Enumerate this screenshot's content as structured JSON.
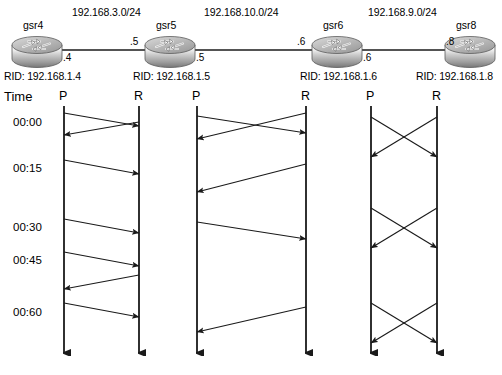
{
  "topology": {
    "networks": [
      {
        "label": "192.168.3.0/24",
        "x": 72,
        "y": 6
      },
      {
        "label": "192.168.10.0/24",
        "x": 204,
        "y": 6
      },
      {
        "label": "192.168.9.0/24",
        "x": 368,
        "y": 6
      }
    ],
    "routers": [
      {
        "name": "gsr4",
        "icon": "router-icon",
        "cx": 37,
        "cy": 45,
        "name_x": 23,
        "name_y": 19
      },
      {
        "name": "gsr5",
        "icon": "router-icon",
        "cx": 170,
        "cy": 45,
        "name_x": 156,
        "name_y": 19
      },
      {
        "name": "gsr6",
        "icon": "router-icon",
        "cx": 337,
        "cy": 45,
        "name_x": 323,
        "name_y": 19
      },
      {
        "name": "gsr8",
        "icon": "router-icon",
        "cx": 470,
        "cy": 45,
        "name_x": 456,
        "name_y": 19
      }
    ],
    "interfaces": [
      {
        "label": ".4",
        "x": 63,
        "y": 52
      },
      {
        "label": ".5",
        "x": 130,
        "y": 36
      },
      {
        "label": ".5",
        "x": 196,
        "y": 52
      },
      {
        "label": ".6",
        "x": 297,
        "y": 36
      },
      {
        "label": ".6",
        "x": 363,
        "y": 52
      },
      {
        "label": ".8",
        "x": 446,
        "y": 36
      }
    ],
    "rids": [
      {
        "label": "RID: 192.168.1.4",
        "x": 4,
        "y": 70
      },
      {
        "label": "RID: 192.168.1.5",
        "x": 133,
        "y": 70
      },
      {
        "label": "RID: 192.168.1.6",
        "x": 300,
        "y": 70
      },
      {
        "label": "RID: 192.168.1.8",
        "x": 416,
        "y": 70
      }
    ]
  },
  "timing": {
    "time_axis_label": "Time",
    "time_label_x": 4,
    "time_label_y": 89,
    "ticks": [
      {
        "label": "00:00",
        "x": 13,
        "y": 116
      },
      {
        "label": "00:15",
        "x": 13,
        "y": 162
      },
      {
        "label": "00:30",
        "x": 13,
        "y": 221
      },
      {
        "label": "00:45",
        "x": 13,
        "y": 254
      },
      {
        "label": "00:60",
        "x": 13,
        "y": 306
      }
    ],
    "columns": [
      {
        "label": "P",
        "x": 59,
        "line_x": 64,
        "header_y": 89
      },
      {
        "label": "R",
        "x": 134,
        "line_x": 139,
        "header_y": 89
      },
      {
        "label": "P",
        "x": 192,
        "line_x": 197,
        "header_y": 89
      },
      {
        "label": "R",
        "x": 301,
        "line_x": 306,
        "header_y": 89
      },
      {
        "label": "P",
        "x": 366,
        "line_x": 371,
        "header_y": 89
      },
      {
        "label": "R",
        "x": 432,
        "line_x": 437,
        "header_y": 89
      }
    ],
    "lifeline_top": 106,
    "lifeline_bottom": 362,
    "groups": [
      {
        "name": "group-gsr4-gsr5",
        "left_x": 64,
        "right_x": 139,
        "messages": [
          {
            "dir": "lr",
            "y1": 113,
            "y2": 126
          },
          {
            "dir": "rl",
            "y1": 122,
            "y2": 135
          },
          {
            "dir": "lr",
            "y1": 160,
            "y2": 174
          },
          {
            "dir": "lr",
            "y1": 219,
            "y2": 233
          },
          {
            "dir": "lr",
            "y1": 252,
            "y2": 266
          },
          {
            "dir": "rl",
            "y1": 275,
            "y2": 289
          },
          {
            "dir": "lr",
            "y1": 303,
            "y2": 317
          }
        ]
      },
      {
        "name": "group-gsr5-gsr6",
        "left_x": 197,
        "right_x": 306,
        "messages": [
          {
            "dir": "lr",
            "y1": 116,
            "y2": 133
          },
          {
            "dir": "rl",
            "y1": 113,
            "y2": 139
          },
          {
            "dir": "rl",
            "y1": 164,
            "y2": 192
          },
          {
            "dir": "lr",
            "y1": 222,
            "y2": 239
          },
          {
            "dir": "rl",
            "y1": 307,
            "y2": 332
          }
        ]
      },
      {
        "name": "group-gsr6-gsr8",
        "left_x": 371,
        "right_x": 437,
        "messages": [
          {
            "dir": "lr",
            "y1": 117,
            "y2": 157
          },
          {
            "dir": "rl",
            "y1": 117,
            "y2": 157
          },
          {
            "dir": "lr",
            "y1": 208,
            "y2": 248
          },
          {
            "dir": "rl",
            "y1": 208,
            "y2": 248
          },
          {
            "dir": "lr",
            "y1": 303,
            "y2": 343
          },
          {
            "dir": "rl",
            "y1": 303,
            "y2": 343
          }
        ]
      }
    ]
  },
  "colors": {
    "line": "#1a1a1a",
    "text": "#000000",
    "router_light": "#f2f2f2",
    "router_mid": "#b8b8b8",
    "router_dark": "#6e6e6e",
    "background": "#ffffff"
  }
}
